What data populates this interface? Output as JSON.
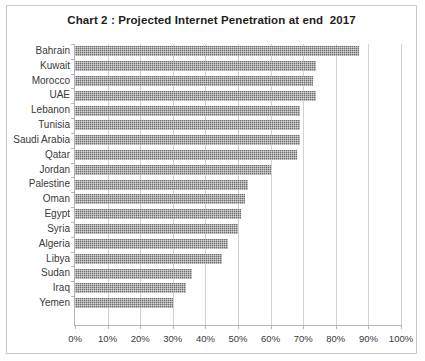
{
  "chart_data": {
    "type": "bar",
    "orientation": "horizontal",
    "title": "Chart 2 : Projected Internet Penetration at end  2017",
    "xlabel": "",
    "ylabel": "",
    "xlim": [
      0,
      100
    ],
    "xtick_labels": [
      "0%",
      "10%",
      "20%",
      "30%",
      "40%",
      "50%",
      "60%",
      "70%",
      "80%",
      "90%",
      "100%"
    ],
    "xtick_values": [
      0,
      10,
      20,
      30,
      40,
      50,
      60,
      70,
      80,
      90,
      100
    ],
    "xtick_interval": 10,
    "grid": true,
    "grid_axis": "x",
    "legend": null,
    "legend_position": "none",
    "bar_color": "#6e6e6e",
    "bar_pattern": "checkered-hatch",
    "categories": [
      "Bahrain",
      "Kuwait",
      "Morocco",
      "UAE",
      "Lebanon",
      "Tunisia",
      "Saudi Arabia",
      "Qatar",
      "Jordan",
      "Palestine",
      "Oman",
      "Egypt",
      "Syria",
      "Algeria",
      "Libya",
      "Sudan",
      "Iraq",
      "Yemen"
    ],
    "values": [
      87,
      74,
      73,
      74,
      69,
      69,
      69,
      68,
      60,
      53,
      52,
      51,
      50,
      47,
      45,
      36,
      34,
      30
    ],
    "value_unit": "%",
    "points": [
      {
        "category": "Bahrain",
        "value": 87
      },
      {
        "category": "Kuwait",
        "value": 74
      },
      {
        "category": "Morocco",
        "value": 73
      },
      {
        "category": "UAE",
        "value": 74
      },
      {
        "category": "Lebanon",
        "value": 69
      },
      {
        "category": "Tunisia",
        "value": 69
      },
      {
        "category": "Saudi Arabia",
        "value": 69
      },
      {
        "category": "Qatar",
        "value": 68
      },
      {
        "category": "Jordan",
        "value": 60
      },
      {
        "category": "Palestine",
        "value": 53
      },
      {
        "category": "Oman",
        "value": 52
      },
      {
        "category": "Egypt",
        "value": 51
      },
      {
        "category": "Syria",
        "value": 50
      },
      {
        "category": "Algeria",
        "value": 47
      },
      {
        "category": "Libya",
        "value": 45
      },
      {
        "category": "Sudan",
        "value": 36
      },
      {
        "category": "Iraq",
        "value": 34
      },
      {
        "category": "Yemen",
        "value": 30
      }
    ]
  }
}
